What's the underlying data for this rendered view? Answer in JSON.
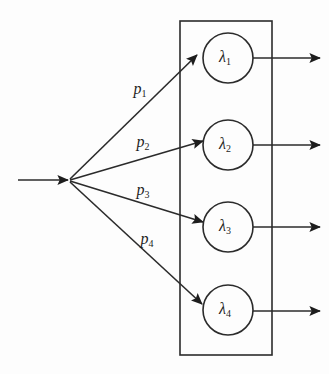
{
  "diagram": {
    "background_color": "#fdfdfd",
    "line_color": "#2b2b2b",
    "text_color": "#1d1d1d",
    "container": {
      "name": "system-boundary-box",
      "x": 180,
      "y": 21,
      "width": 92,
      "height": 334
    },
    "source": {
      "name": "split-point",
      "x": 68,
      "y": 180,
      "input_arrow_start_x": 18
    },
    "nodes": [
      {
        "id": "node-1",
        "symbol": "λ",
        "subscript": "1",
        "cx": 228,
        "cy": 58,
        "r": 25
      },
      {
        "id": "node-2",
        "symbol": "λ",
        "subscript": "2",
        "cx": 228,
        "cy": 145,
        "r": 25
      },
      {
        "id": "node-3",
        "symbol": "λ",
        "subscript": "3",
        "cx": 228,
        "cy": 227,
        "r": 25
      },
      {
        "id": "node-4",
        "symbol": "λ",
        "subscript": "4",
        "cx": 228,
        "cy": 310,
        "r": 25
      }
    ],
    "edges": [
      {
        "id": "edge-p1",
        "symbol": "p",
        "subscript": "1",
        "label_x": 140,
        "label_y": 90,
        "from_x": 70,
        "from_y": 179,
        "to_x": 197,
        "to_y": 55
      },
      {
        "id": "edge-p2",
        "symbol": "p",
        "subscript": "2",
        "label_x": 143,
        "label_y": 143,
        "from_x": 70,
        "from_y": 180,
        "to_x": 203,
        "to_y": 141
      },
      {
        "id": "edge-p3",
        "symbol": "p",
        "subscript": "3",
        "label_x": 143,
        "label_y": 191,
        "from_x": 70,
        "from_y": 181,
        "to_x": 203,
        "to_y": 222
      },
      {
        "id": "edge-p4",
        "symbol": "p",
        "subscript": "4",
        "label_x": 147,
        "label_y": 240,
        "from_x": 70,
        "from_y": 182,
        "to_x": 202,
        "to_y": 304
      }
    ],
    "outputs": [
      {
        "id": "output-1",
        "y": 58,
        "start_x": 253,
        "end_x": 320
      },
      {
        "id": "output-2",
        "y": 145,
        "start_x": 253,
        "end_x": 320
      },
      {
        "id": "output-3",
        "y": 227,
        "start_x": 253,
        "end_x": 320
      },
      {
        "id": "output-4",
        "y": 311,
        "start_x": 253,
        "end_x": 320
      }
    ]
  }
}
